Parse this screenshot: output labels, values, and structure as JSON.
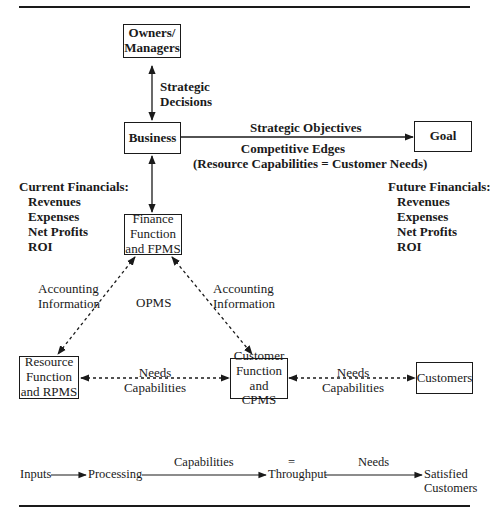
{
  "nodes": {
    "owners": {
      "line1": "Owners/",
      "line2": "Managers"
    },
    "business": {
      "label": "Business"
    },
    "goal": {
      "label": "Goal"
    },
    "finance": {
      "line1": "Finance",
      "line2": "Function",
      "line3": "and FPMS"
    },
    "resource": {
      "line1": "Resource",
      "line2": "Function",
      "line3": "and RPMS"
    },
    "customer_fn": {
      "line1": "Customer",
      "line2": "Function",
      "line3": "and CPMS"
    },
    "customers": {
      "label": "Customers"
    }
  },
  "edges": {
    "strategic_decisions": {
      "line1": "Strategic",
      "line2": "Decisions"
    },
    "strategic_objectives": "Strategic Objectives",
    "competitive_edges": {
      "line1": "Competitive Edges",
      "line2": "(Resource Capabilities = Customer Needs)"
    },
    "accounting_left": {
      "line1": "Accounting",
      "line2": "Information"
    },
    "accounting_right": {
      "line1": "Accounting",
      "line2": "Information"
    },
    "opms": "OPMS",
    "needs_caps_1": {
      "line1": "Needs",
      "line2": "Capabilities"
    },
    "needs_caps_2": {
      "line1": "Needs",
      "line2": "Capabilities"
    }
  },
  "current_financials": {
    "title": "Current Financials:",
    "items": [
      "Revenues",
      "Expenses",
      "Net Profits",
      "ROI"
    ]
  },
  "future_financials": {
    "title": "Future Financials:",
    "items": [
      "Revenues",
      "Expenses",
      "Net Profits",
      "ROI"
    ]
  },
  "flow": {
    "inputs": "Inputs",
    "processing": "Processing",
    "capabilities": "Capabilities",
    "equals": "=",
    "throughput": "Throughput",
    "needs": "Needs",
    "satisfied_line1": "Satisfied",
    "satisfied_line2": "Customers"
  }
}
